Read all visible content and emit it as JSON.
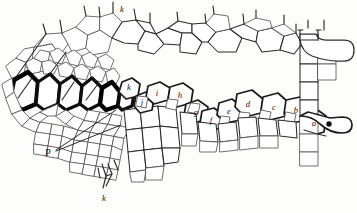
{
  "figure": {
    "background_color": "#fdfdfc",
    "ink_color": "#1a1a1a",
    "width": 357,
    "height": 213
  },
  "labels": [
    {
      "id": "label-k-top",
      "text": "k",
      "x": 122,
      "y": 12,
      "style": "italic"
    },
    {
      "id": "label-k-mid",
      "text": "k",
      "x": 129,
      "y": 90,
      "style": "italic"
    },
    {
      "id": "label-j",
      "text": "j",
      "x": 142,
      "y": 101,
      "style": "italic"
    },
    {
      "id": "label-i",
      "text": "i",
      "x": 155,
      "y": 96,
      "style": "italic"
    },
    {
      "id": "label-h",
      "text": "h",
      "x": 178,
      "y": 98,
      "style": "italic"
    },
    {
      "id": "label-g",
      "text": "g",
      "x": 194,
      "y": 113,
      "style": "italic"
    },
    {
      "id": "label-f",
      "text": "f",
      "x": 209,
      "y": 120,
      "style": "italic"
    },
    {
      "id": "label-e",
      "text": "e",
      "x": 227,
      "y": 113,
      "style": "italic"
    },
    {
      "id": "label-d",
      "text": "d",
      "x": 247,
      "y": 105,
      "style": "italic"
    },
    {
      "id": "label-c",
      "text": "c",
      "x": 272,
      "y": 108,
      "style": "italic"
    },
    {
      "id": "label-b",
      "text": "b",
      "x": 294,
      "y": 112,
      "style": "italic"
    },
    {
      "id": "label-a",
      "text": "a",
      "x": 312,
      "y": 124,
      "style": "italic"
    },
    {
      "id": "label-P",
      "text": "P",
      "x": 48,
      "y": 155,
      "style": "roman"
    },
    {
      "id": "label-k-bottom",
      "text": "k",
      "x": 104,
      "y": 200,
      "style": "italic"
    }
  ],
  "leader_lines": [
    {
      "id": "leader-P-upper",
      "from_x": 56,
      "from_y": 150,
      "to_x": 116,
      "to_y": 110
    },
    {
      "id": "leader-P-lower",
      "from_x": 56,
      "from_y": 151,
      "to_x": 121,
      "to_y": 125
    }
  ],
  "regions": [
    {
      "id": "sclerenchyma-band",
      "description": "row of thick-walled dark cells, left"
    },
    {
      "id": "parenchyma-upper",
      "description": "thin-walled polygonal cells, upper"
    },
    {
      "id": "parenchyma-lower",
      "description": "small thin-walled cells, lower left"
    },
    {
      "id": "epidermis-row",
      "description": "labelled epidermal cell row a-k"
    },
    {
      "id": "trichome",
      "description": "hook-shaped hair on right margin"
    },
    {
      "id": "hair-base-bottom",
      "description": "small hair at lower margin"
    }
  ]
}
